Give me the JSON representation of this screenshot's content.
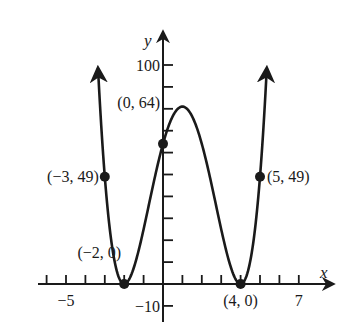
{
  "chart_data": {
    "type": "line",
    "title": "",
    "function": "f(x) = (x + 2)^2 (x - 4)^2",
    "xlabel": "x",
    "ylabel": "y",
    "xlim": [
      -5.5,
      8.7
    ],
    "ylim": [
      -12,
      110
    ],
    "x_ticks": {
      "start": -6,
      "end": 7,
      "step": 1
    },
    "y_ticks": {
      "start": -10,
      "end": 100,
      "step": 10
    },
    "tick_labels": {
      "x": [
        {
          "value": -5,
          "label": "−5"
        },
        {
          "value": 7,
          "label": "7"
        }
      ],
      "y": [
        {
          "value": 100,
          "label": "100"
        },
        {
          "value": -10,
          "label": "−10"
        }
      ]
    },
    "curve": {
      "x_min": -3.35,
      "x_max": 5.35,
      "end_arrows": true
    },
    "points": [
      {
        "x": -3,
        "y": 49,
        "label": "(−3, 49)"
      },
      {
        "x": -2,
        "y": 0,
        "label": "(−2, 0)"
      },
      {
        "x": 0,
        "y": 64,
        "label": "(0, 64)"
      },
      {
        "x": 4,
        "y": 0,
        "label": "(4, 0)"
      },
      {
        "x": 5,
        "y": 49,
        "label": "(5, 49)"
      }
    ],
    "grid": false,
    "legend": null
  },
  "colors": {
    "ink": "#1a1a1a",
    "background": "#ffffff"
  }
}
